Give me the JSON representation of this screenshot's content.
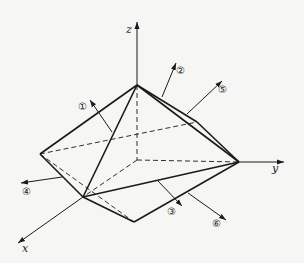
{
  "diagram": {
    "type": "3d-polyhedron-with-normal-vectors",
    "axes": {
      "x": {
        "label": "x"
      },
      "y": {
        "label": "y"
      },
      "z": {
        "label": "z"
      }
    },
    "face_normals": [
      {
        "id": 1,
        "label": "①"
      },
      {
        "id": 2,
        "label": "②"
      },
      {
        "id": 3,
        "label": "③"
      },
      {
        "id": 4,
        "label": "④"
      },
      {
        "id": 5,
        "label": "⑤"
      },
      {
        "id": 6,
        "label": "⑥"
      }
    ],
    "colors": {
      "background": "#f6f6f4",
      "line": "#1a1a1a"
    }
  }
}
